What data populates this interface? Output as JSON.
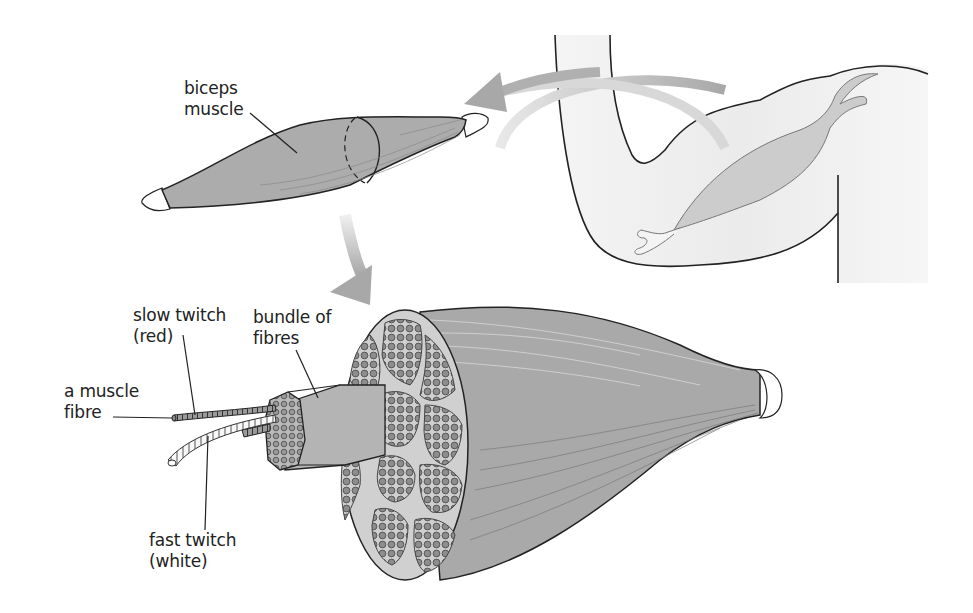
{
  "diagram": {
    "labels": {
      "biceps_line1": "biceps",
      "biceps_line2": "muscle",
      "slow_line1": "slow twitch",
      "slow_line2": "(red)",
      "bundle_line1": "bundle of",
      "bundle_line2": "fibres",
      "fibre_line1": "a muscle",
      "fibre_line2": "fibre",
      "fast_line1": "fast twitch",
      "fast_line2": "(white)"
    },
    "colors": {
      "muscle": "#a9a9a9",
      "muscle_light": "#c4c4c4",
      "arm": "#eeeeee",
      "arrow": "#b3b3b3",
      "outline": "#222222",
      "tendon": "#ffffff"
    }
  }
}
